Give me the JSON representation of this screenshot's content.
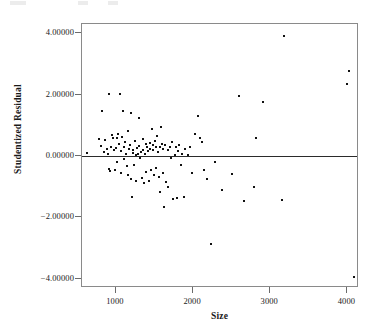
{
  "figure": {
    "axis_line_color": "#8a8a8a",
    "point_color": "#111111",
    "reference_line_color": "#2b2b2b"
  },
  "chart_data": {
    "type": "scatter",
    "title": "",
    "xlabel": "Size",
    "ylabel": "Studentized Residual",
    "xlim": [
      560,
      4150
    ],
    "ylim": [
      -4.3,
      4.3
    ],
    "grid": false,
    "legend": null,
    "xticks": [
      1000,
      2000,
      3000,
      4000
    ],
    "xtick_labels": [
      "1000",
      "2000",
      "3000",
      "4000"
    ],
    "yticks": [
      4,
      2,
      0,
      -2,
      -4
    ],
    "ytick_labels": [
      "4.00000",
      "2.00000",
      "0.00000",
      "-2.00000",
      "-4.00000"
    ],
    "reference_line": {
      "orientation": "horizontal",
      "y": 0.0
    },
    "n_points": 115,
    "points": [
      [
        620,
        0.1
      ],
      [
        780,
        0.55
      ],
      [
        800,
        0.33
      ],
      [
        820,
        1.45
      ],
      [
        840,
        0.12
      ],
      [
        860,
        0.52
      ],
      [
        880,
        0.22
      ],
      [
        900,
        0.05
      ],
      [
        905,
        2.03
      ],
      [
        915,
        -0.42
      ],
      [
        920,
        -0.5
      ],
      [
        930,
        0.3
      ],
      [
        950,
        0.68
      ],
      [
        960,
        0.6
      ],
      [
        975,
        0.18
      ],
      [
        985,
        -0.47
      ],
      [
        1000,
        0.25
      ],
      [
        1010,
        0.58
      ],
      [
        1020,
        -0.2
      ],
      [
        1030,
        0.72
      ],
      [
        1045,
        0.4
      ],
      [
        1055,
        2.03
      ],
      [
        1060,
        0.15
      ],
      [
        1070,
        -0.55
      ],
      [
        1080,
        0.62
      ],
      [
        1090,
        1.45
      ],
      [
        1100,
        0.28
      ],
      [
        1110,
        -0.1
      ],
      [
        1120,
        0.44
      ],
      [
        1130,
        0.05
      ],
      [
        1140,
        -0.33
      ],
      [
        1150,
        0.8
      ],
      [
        1160,
        -0.62
      ],
      [
        1170,
        0.22
      ],
      [
        1180,
        0.35
      ],
      [
        1190,
        -0.75
      ],
      [
        1200,
        1.4
      ],
      [
        1205,
        -1.33
      ],
      [
        1215,
        0.1
      ],
      [
        1225,
        0.18
      ],
      [
        1235,
        -0.28
      ],
      [
        1245,
        0.48
      ],
      [
        1255,
        0.02
      ],
      [
        1265,
        -0.8
      ],
      [
        1275,
        0.26
      ],
      [
        1285,
        0.08
      ],
      [
        1295,
        1.25
      ],
      [
        1305,
        0.33
      ],
      [
        1315,
        -0.05
      ],
      [
        1325,
        0.12
      ],
      [
        1335,
        -0.72
      ],
      [
        1345,
        0.55
      ],
      [
        1355,
        0.2
      ],
      [
        1365,
        -0.88
      ],
      [
        1375,
        0.06
      ],
      [
        1385,
        0.38
      ],
      [
        1395,
        -0.52
      ],
      [
        1405,
        0.3
      ],
      [
        1415,
        0.15
      ],
      [
        1425,
        -0.8
      ],
      [
        1435,
        0.42
      ],
      [
        1445,
        0.24
      ],
      [
        1455,
        -0.45
      ],
      [
        1465,
        0.88
      ],
      [
        1475,
        0.35
      ],
      [
        1485,
        0.18
      ],
      [
        1495,
        -0.62
      ],
      [
        1505,
        0.5
      ],
      [
        1515,
        0.28
      ],
      [
        1525,
        -0.38
      ],
      [
        1535,
        0.66
      ],
      [
        1545,
        0.12
      ],
      [
        1555,
        -0.7
      ],
      [
        1565,
        0.3
      ],
      [
        1575,
        -1.18
      ],
      [
        1585,
        0.95
      ],
      [
        1595,
        0.4
      ],
      [
        1605,
        -0.55
      ],
      [
        1615,
        0.22
      ],
      [
        1625,
        -1.65
      ],
      [
        1640,
        0.35
      ],
      [
        1655,
        -0.86
      ],
      [
        1670,
        0.18
      ],
      [
        1680,
        -1.02
      ],
      [
        1695,
        0.3
      ],
      [
        1710,
        -0.05
      ],
      [
        1725,
        0.45
      ],
      [
        1740,
        -1.4
      ],
      [
        1760,
        0.02
      ],
      [
        1775,
        0.28
      ],
      [
        1790,
        -1.38
      ],
      [
        1805,
        0.15
      ],
      [
        1820,
        0.35
      ],
      [
        1840,
        -0.3
      ],
      [
        1860,
        0.05
      ],
      [
        1880,
        -1.35
      ],
      [
        1900,
        0.22
      ],
      [
        1930,
        0.02
      ],
      [
        1960,
        0.3
      ],
      [
        1990,
        -0.55
      ],
      [
        2030,
        0.72
      ],
      [
        2060,
        1.3
      ],
      [
        2090,
        0.58
      ],
      [
        2110,
        0.45
      ],
      [
        2140,
        -0.45
      ],
      [
        2180,
        -0.75
      ],
      [
        2230,
        -2.88
      ],
      [
        2280,
        -0.18
      ],
      [
        2380,
        -1.12
      ],
      [
        2500,
        -0.58
      ],
      [
        2600,
        1.95
      ],
      [
        2660,
        -1.48
      ],
      [
        2790,
        -1.02
      ],
      [
        2810,
        0.6
      ],
      [
        2900,
        1.75
      ],
      [
        3150,
        -1.42
      ],
      [
        3180,
        3.9
      ],
      [
        4000,
        2.35
      ],
      [
        4020,
        2.78
      ],
      [
        4090,
        -3.95
      ]
    ]
  }
}
